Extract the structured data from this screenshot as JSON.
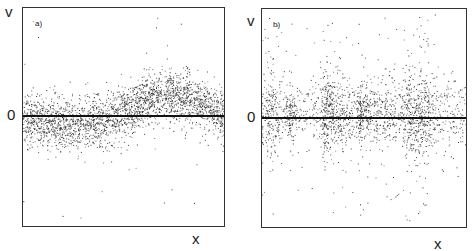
{
  "chart_data": [
    {
      "type": "scatter",
      "panel_label": "a)",
      "xlabel": "x",
      "ylabel": "v",
      "y_tick_labels": [
        "0"
      ],
      "grid": false,
      "legend": null,
      "description": "Dense scatter of points around zero line; band slightly below zero on left half, rising above zero (peak ~ +0.35 of frame half-height) around x≈0.7, returning toward zero at right edge",
      "x_range": [
        0,
        1
      ],
      "y_range": [
        -1,
        1
      ],
      "trend": {
        "x": [
          0.0,
          0.2,
          0.4,
          0.55,
          0.7,
          0.85,
          1.0
        ],
        "mean_v": [
          0.0,
          -0.08,
          -0.05,
          0.08,
          0.2,
          0.15,
          0.02
        ]
      },
      "spread": 0.12,
      "outlier_fraction": 0.01,
      "n_points": 2600
    },
    {
      "type": "scatter",
      "panel_label": "b)",
      "xlabel": "x",
      "ylabel": "v",
      "y_tick_labels": [
        "0"
      ],
      "grid": false,
      "legend": null,
      "description": "Scatter centered on zero with vertical clustered streaks and many widely scattered outliers spanning the full vertical range",
      "x_range": [
        0,
        1
      ],
      "y_range": [
        -1,
        1
      ],
      "trend": {
        "x": [
          0.0,
          0.5,
          1.0
        ],
        "mean_v": [
          0.05,
          0.05,
          0.03
        ]
      },
      "spread": 0.16,
      "outlier_fraction": 0.08,
      "n_points": 2200
    }
  ],
  "panels": {
    "a": {
      "tag": "a)",
      "v_label": "v",
      "zero_label": "0",
      "x_label": "x"
    },
    "b": {
      "tag": "b)",
      "v_label": "v",
      "zero_label": "0",
      "x_label": "x"
    }
  },
  "colors": {
    "dots": "#2a2a2a",
    "axis": "#111111",
    "frame": "#333333"
  }
}
